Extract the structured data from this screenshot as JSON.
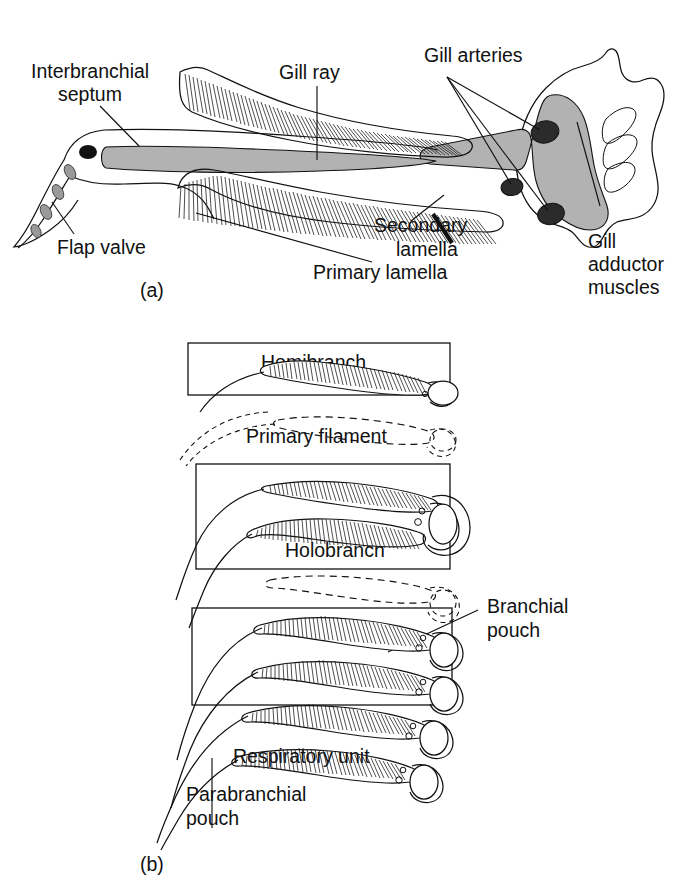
{
  "figure": {
    "kind": "two-panel anatomical line diagram of elasmobranch gill structure",
    "background": "#ffffff",
    "ink": "#111111",
    "cartilage_fill": "#b2b2b2",
    "artery_fill": "#2b2b2b"
  },
  "panel_a": {
    "caption": "(a)",
    "labels": {
      "interbranchial_septum": "Interbranchial\nseptum",
      "interbranchial_septum_l1": "Interbranchial",
      "interbranchial_septum_l2": "septum",
      "gill_ray": "Gill ray",
      "gill_arteries": "Gill arteries",
      "flap_valve": "Flap valve",
      "secondary_lamella_l1": "Secondary",
      "secondary_lamella_l2": "lamella",
      "primary_lamella": "Primary lamella",
      "gill_adductor_l1": "Gill",
      "gill_adductor_l2": "adductor",
      "gill_adductor_l3": "muscles"
    },
    "artery_count": 3
  },
  "panel_b": {
    "caption": "(b)",
    "labels": {
      "hemibranch": "Hemibranch",
      "primary_filament": "Primary filament",
      "holobranch": "Holobranch",
      "branchial_pouch_l1": "Branchial",
      "branchial_pouch_l2": "pouch",
      "respiratory_unit": "Respiratory unit",
      "parabranchial_pouch_l1": "Parabranchial",
      "parabranchial_pouch_l2": "pouch"
    },
    "boxes": [
      "Hemibranch",
      "Holobranch",
      "Branchial pouch"
    ],
    "filament_rows": 6
  }
}
